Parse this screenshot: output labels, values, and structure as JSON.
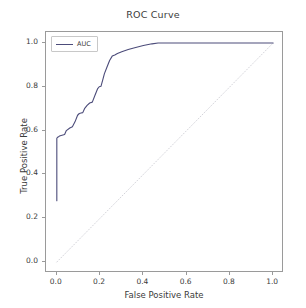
{
  "chart_data": {
    "type": "line",
    "title": "ROC Curve",
    "xlabel": "False Positive Rate",
    "ylabel": "True Positive Rate",
    "xlim": [
      -0.05,
      1.05
    ],
    "ylim": [
      -0.05,
      1.05
    ],
    "grid": false,
    "legend_position": "upper left",
    "legend_entries": [
      "AUC"
    ],
    "xticks": [
      "0.0",
      "0.2",
      "0.4",
      "0.6",
      "0.8",
      "1.0"
    ],
    "xtick_values": [
      0.0,
      0.2,
      0.4,
      0.6,
      0.8,
      1.0
    ],
    "yticks": [
      "0.0",
      "0.2",
      "0.4",
      "0.6",
      "0.8",
      "1.0"
    ],
    "ytick_values": [
      0.0,
      0.2,
      0.4,
      0.6,
      0.8,
      1.0
    ],
    "series": [
      {
        "name": "AUC",
        "color": "#4c4c7a",
        "style": "solid",
        "x": [
          0.0,
          0.0,
          0.004,
          0.008,
          0.012,
          0.02,
          0.028,
          0.036,
          0.044,
          0.06,
          0.072,
          0.084,
          0.096,
          0.104,
          0.112,
          0.12,
          0.128,
          0.14,
          0.152,
          0.164,
          0.176,
          0.188,
          0.196,
          0.204,
          0.212,
          0.22,
          0.232,
          0.244,
          0.256,
          0.268,
          0.28,
          0.3,
          0.33,
          0.36,
          0.4,
          0.44,
          0.468,
          0.6,
          0.8,
          1.0
        ],
        "y": [
          0.28,
          0.565,
          0.57,
          0.572,
          0.575,
          0.578,
          0.58,
          0.582,
          0.6,
          0.612,
          0.618,
          0.64,
          0.67,
          0.678,
          0.68,
          0.682,
          0.7,
          0.715,
          0.726,
          0.73,
          0.76,
          0.79,
          0.8,
          0.802,
          0.83,
          0.86,
          0.89,
          0.92,
          0.94,
          0.945,
          0.952,
          0.96,
          0.97,
          0.978,
          0.988,
          0.996,
          1.0,
          1.0,
          1.0,
          1.0
        ]
      },
      {
        "name": "chance-diagonal",
        "color": "#cfcfd6",
        "style": "dotted",
        "x": [
          0.0,
          1.0
        ],
        "y": [
          0.0,
          1.0
        ]
      }
    ]
  },
  "legend": {
    "label": "AUC"
  },
  "axes": {
    "title": "ROC Curve",
    "xlabel": "False Positive Rate",
    "ylabel": "True Positive Rate"
  },
  "colors": {
    "curve": "#4c4c7a",
    "diagonal": "#cfcfd6",
    "frame": "#9a9a9a",
    "text": "#3b3b3b",
    "background": "#ffffff"
  }
}
